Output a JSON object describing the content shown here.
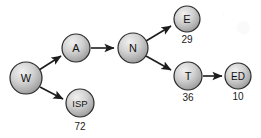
{
  "diagram": {
    "type": "directed-graph",
    "title": "",
    "background_color": "#ffffff",
    "node_fill_light": "#e8e8e8",
    "node_fill_dark": "#8f8f8f",
    "node_stroke_color": "#2b2b2b",
    "edge_color": "#1c1c1c",
    "nodes": [
      {
        "id": "W",
        "label": "W",
        "value": "",
        "cx": 26,
        "cy": 78,
        "r": 16,
        "font_size": 11
      },
      {
        "id": "A",
        "label": "A",
        "value": "",
        "cx": 76,
        "cy": 48,
        "r": 14,
        "font_size": 11
      },
      {
        "id": "ISP",
        "label": "ISP",
        "value": "72",
        "cx": 80,
        "cy": 103,
        "r": 14,
        "font_size": 9
      },
      {
        "id": "N",
        "label": "N",
        "value": "",
        "cx": 133,
        "cy": 48,
        "r": 15,
        "font_size": 11
      },
      {
        "id": "E",
        "label": "E",
        "value": "29",
        "cx": 187,
        "cy": 19,
        "r": 13,
        "font_size": 11
      },
      {
        "id": "T",
        "label": "T",
        "value": "36",
        "cx": 188,
        "cy": 76,
        "r": 14,
        "font_size": 11
      },
      {
        "id": "ED",
        "label": "ED",
        "value": "10",
        "cx": 238,
        "cy": 76,
        "r": 13,
        "font_size": 10
      }
    ],
    "edges": [
      {
        "from": "W",
        "to": "A",
        "label": ""
      },
      {
        "from": "W",
        "to": "ISP",
        "label": ""
      },
      {
        "from": "A",
        "to": "N",
        "label": ""
      },
      {
        "from": "N",
        "to": "E",
        "label": ""
      },
      {
        "from": "N",
        "to": "T",
        "label": ""
      },
      {
        "from": "T",
        "to": "ED",
        "label": ""
      }
    ]
  }
}
